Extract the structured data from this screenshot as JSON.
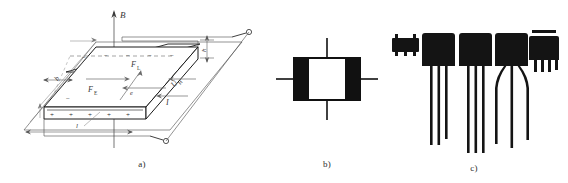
{
  "figure": {
    "panels": [
      {
        "id": "a",
        "caption": "a)",
        "title": "Hall effect principle diagram",
        "labels": {
          "magnetic_field": "B",
          "lorentz_force": "F",
          "lorentz_force_sub": "L",
          "electric_force": "F",
          "electric_force_sub": "E",
          "hall_voltage": "U",
          "hall_voltage_sub": "H",
          "current": "I",
          "electron": "e",
          "length": "l",
          "width": "b",
          "thickness": "h",
          "negative_sign": "−",
          "positive_sign": "+"
        },
        "top_face_charges": [
          "−",
          "−",
          "−",
          "−",
          "−",
          "−"
        ],
        "front_face_charges": [
          "+",
          "+",
          "+",
          "+",
          "+",
          "+"
        ],
        "terminal_count": 2
      },
      {
        "id": "b",
        "caption": "b)",
        "title": "Hall element circuit symbol",
        "terminal_count": 4
      },
      {
        "id": "c",
        "caption": "c)",
        "title": "Hall sensor component packages",
        "packages": [
          {
            "name": "smd-package",
            "leads": 3
          },
          {
            "name": "to92-package-long-leads",
            "leads": 3
          },
          {
            "name": "to92-package-long-leads",
            "leads": 3
          },
          {
            "name": "to92-package-spread-leads",
            "leads": 3
          },
          {
            "name": "sip-package-short-leads",
            "leads": 4
          }
        ]
      }
    ]
  },
  "colors": {
    "background": "#ffffff",
    "line": "#3a3a3a",
    "line_dark": "#1a1a1a",
    "component_body": "#141414",
    "lead": "#181818"
  }
}
